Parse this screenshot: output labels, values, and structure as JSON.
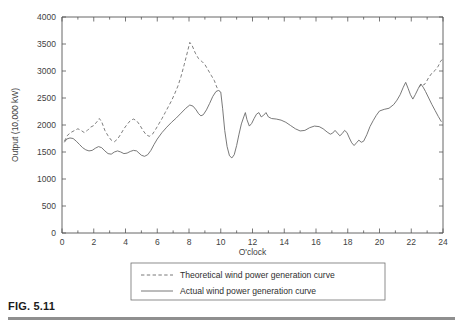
{
  "figure": {
    "label": "FIG. 5.11",
    "caption_rule": true
  },
  "chart_data": {
    "type": "line",
    "title": "",
    "xlabel": "O'clock",
    "ylabel": "Output (10,000 kW)",
    "xlim": [
      0,
      24
    ],
    "ylim": [
      0,
      4000
    ],
    "xticks": [
      0,
      2,
      4,
      6,
      8,
      10,
      12,
      14,
      16,
      18,
      20,
      22,
      24
    ],
    "xtick_labels": [
      "0",
      "2",
      "4",
      "6",
      "8",
      "10",
      "12",
      "14",
      "16",
      "18",
      "20",
      "22",
      "24"
    ],
    "xticks_minor": [
      1,
      3,
      5,
      7,
      9,
      11,
      13,
      15,
      17,
      19,
      21,
      23
    ],
    "yticks": [
      0,
      500,
      1000,
      1500,
      2000,
      2500,
      3000,
      3500,
      4000
    ],
    "ytick_labels": [
      "0",
      "500",
      "1000",
      "1500",
      "2000",
      "2500",
      "3000",
      "3500",
      "4000"
    ],
    "grid": false,
    "legend_position": "below-axes",
    "series": [
      {
        "name": "Theoretical wind power generation curve",
        "style": "dashed",
        "color": "#6f6f6f",
        "points": [
          [
            0.15,
            1700
          ],
          [
            0.35,
            1810
          ],
          [
            0.55,
            1860
          ],
          [
            0.8,
            1900
          ],
          [
            1.0,
            1930
          ],
          [
            1.2,
            1900
          ],
          [
            1.4,
            1860
          ],
          [
            1.6,
            1900
          ],
          [
            1.8,
            1960
          ],
          [
            2.0,
            1990
          ],
          [
            2.2,
            2060
          ],
          [
            2.35,
            2120
          ],
          [
            2.5,
            2060
          ],
          [
            2.7,
            1900
          ],
          [
            2.9,
            1800
          ],
          [
            3.1,
            1720
          ],
          [
            3.3,
            1690
          ],
          [
            3.5,
            1740
          ],
          [
            3.7,
            1830
          ],
          [
            3.9,
            1930
          ],
          [
            4.1,
            2010
          ],
          [
            4.3,
            2080
          ],
          [
            4.5,
            2110
          ],
          [
            4.7,
            2080
          ],
          [
            4.9,
            2000
          ],
          [
            5.1,
            1900
          ],
          [
            5.3,
            1820
          ],
          [
            5.5,
            1790
          ],
          [
            5.7,
            1830
          ],
          [
            5.9,
            1920
          ],
          [
            6.1,
            2020
          ],
          [
            6.3,
            2120
          ],
          [
            6.5,
            2230
          ],
          [
            6.7,
            2340
          ],
          [
            6.9,
            2450
          ],
          [
            7.1,
            2580
          ],
          [
            7.3,
            2720
          ],
          [
            7.5,
            2900
          ],
          [
            7.7,
            3120
          ],
          [
            7.9,
            3350
          ],
          [
            8.05,
            3530
          ],
          [
            8.2,
            3470
          ],
          [
            8.4,
            3330
          ],
          [
            8.6,
            3230
          ],
          [
            8.8,
            3180
          ],
          [
            9.0,
            3120
          ],
          [
            9.2,
            3020
          ],
          [
            9.4,
            2920
          ],
          [
            9.6,
            2820
          ],
          [
            9.75,
            2700
          ],
          [
            9.9,
            2640
          ]
        ]
      },
      {
        "name": "Actual wind power generation curve",
        "style": "solid",
        "color": "#6a6a6a",
        "points": [
          [
            0.15,
            1680
          ],
          [
            0.3,
            1740
          ],
          [
            0.5,
            1760
          ],
          [
            0.7,
            1750
          ],
          [
            0.9,
            1700
          ],
          [
            1.1,
            1640
          ],
          [
            1.3,
            1580
          ],
          [
            1.5,
            1540
          ],
          [
            1.7,
            1520
          ],
          [
            1.9,
            1530
          ],
          [
            2.1,
            1570
          ],
          [
            2.3,
            1600
          ],
          [
            2.5,
            1580
          ],
          [
            2.7,
            1520
          ],
          [
            2.9,
            1470
          ],
          [
            3.1,
            1460
          ],
          [
            3.3,
            1500
          ],
          [
            3.5,
            1520
          ],
          [
            3.7,
            1500
          ],
          [
            3.9,
            1470
          ],
          [
            4.1,
            1480
          ],
          [
            4.3,
            1510
          ],
          [
            4.5,
            1530
          ],
          [
            4.7,
            1520
          ],
          [
            4.85,
            1480
          ],
          [
            5.0,
            1440
          ],
          [
            5.2,
            1420
          ],
          [
            5.4,
            1450
          ],
          [
            5.6,
            1530
          ],
          [
            5.8,
            1640
          ],
          [
            6.0,
            1740
          ],
          [
            6.3,
            1860
          ],
          [
            6.6,
            1960
          ],
          [
            6.9,
            2050
          ],
          [
            7.2,
            2130
          ],
          [
            7.5,
            2220
          ],
          [
            7.8,
            2310
          ],
          [
            8.05,
            2370
          ],
          [
            8.25,
            2350
          ],
          [
            8.45,
            2280
          ],
          [
            8.6,
            2210
          ],
          [
            8.75,
            2170
          ],
          [
            8.9,
            2190
          ],
          [
            9.1,
            2280
          ],
          [
            9.3,
            2400
          ],
          [
            9.5,
            2530
          ],
          [
            9.7,
            2620
          ],
          [
            9.85,
            2640
          ],
          [
            10.0,
            2610
          ],
          [
            10.12,
            2300
          ],
          [
            10.25,
            1900
          ],
          [
            10.4,
            1600
          ],
          [
            10.55,
            1430
          ],
          [
            10.7,
            1390
          ],
          [
            10.85,
            1450
          ],
          [
            11.0,
            1620
          ],
          [
            11.15,
            1830
          ],
          [
            11.3,
            2020
          ],
          [
            11.45,
            2150
          ],
          [
            11.55,
            2230
          ],
          [
            11.65,
            2100
          ],
          [
            11.8,
            1980
          ],
          [
            11.95,
            2030
          ],
          [
            12.1,
            2120
          ],
          [
            12.25,
            2200
          ],
          [
            12.4,
            2230
          ],
          [
            12.55,
            2150
          ],
          [
            12.7,
            2180
          ],
          [
            12.85,
            2230
          ],
          [
            13.0,
            2150
          ],
          [
            13.2,
            2120
          ],
          [
            13.5,
            2110
          ],
          [
            13.8,
            2090
          ],
          [
            14.1,
            2050
          ],
          [
            14.4,
            1990
          ],
          [
            14.7,
            1930
          ],
          [
            15.0,
            1890
          ],
          [
            15.3,
            1900
          ],
          [
            15.6,
            1950
          ],
          [
            15.9,
            1980
          ],
          [
            16.2,
            1970
          ],
          [
            16.45,
            1930
          ],
          [
            16.7,
            1870
          ],
          [
            16.9,
            1830
          ],
          [
            17.05,
            1850
          ],
          [
            17.2,
            1900
          ],
          [
            17.35,
            1850
          ],
          [
            17.5,
            1800
          ],
          [
            17.65,
            1840
          ],
          [
            17.8,
            1900
          ],
          [
            17.95,
            1860
          ],
          [
            18.1,
            1760
          ],
          [
            18.25,
            1670
          ],
          [
            18.4,
            1620
          ],
          [
            18.55,
            1670
          ],
          [
            18.7,
            1720
          ],
          [
            18.85,
            1680
          ],
          [
            19.0,
            1700
          ],
          [
            19.2,
            1820
          ],
          [
            19.4,
            1970
          ],
          [
            19.6,
            2080
          ],
          [
            19.8,
            2180
          ],
          [
            20.0,
            2260
          ],
          [
            20.3,
            2290
          ],
          [
            20.6,
            2310
          ],
          [
            20.9,
            2380
          ],
          [
            21.1,
            2460
          ],
          [
            21.3,
            2560
          ],
          [
            21.5,
            2700
          ],
          [
            21.65,
            2790
          ],
          [
            21.8,
            2680
          ],
          [
            21.95,
            2560
          ],
          [
            22.1,
            2480
          ],
          [
            22.25,
            2560
          ],
          [
            22.45,
            2680
          ],
          [
            22.6,
            2760
          ],
          [
            22.75,
            2700
          ],
          [
            22.9,
            2620
          ],
          [
            23.1,
            2500
          ],
          [
            23.3,
            2380
          ],
          [
            23.5,
            2270
          ],
          [
            23.7,
            2160
          ],
          [
            23.9,
            2060
          ]
        ]
      },
      {
        "name": "Theoretical wind power generation curve (late segment)",
        "style": "dashed",
        "color": "#6f6f6f",
        "points": [
          [
            22.5,
            2700
          ],
          [
            22.65,
            2760
          ],
          [
            22.8,
            2740
          ],
          [
            22.95,
            2800
          ],
          [
            23.1,
            2880
          ],
          [
            23.3,
            2960
          ],
          [
            23.5,
            3010
          ],
          [
            23.7,
            3090
          ],
          [
            23.85,
            3180
          ],
          [
            23.97,
            3220
          ]
        ]
      }
    ],
    "legend_entries": [
      {
        "label": "Theoretical wind power generation curve",
        "style": "dashed"
      },
      {
        "label": "Actual wind power generation curve",
        "style": "solid"
      }
    ]
  }
}
